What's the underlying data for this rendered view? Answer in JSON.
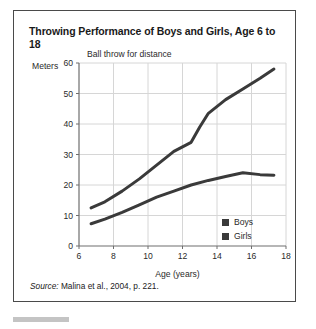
{
  "card": {
    "title": "Throwing Performance of Boys and Girls, Age 6 to 18",
    "subtitle": "Ball throw for distance",
    "source_label": "Source:",
    "source_text": " Malina et al., 2004, p. 221."
  },
  "chart_data": {
    "type": "line",
    "title": "Throwing Performance of Boys and Girls, Age 6 to 18",
    "subtitle": "Ball throw for distance",
    "xlabel": "Age (years)",
    "ylabel": "Meters",
    "xlim": [
      6,
      18
    ],
    "ylim": [
      0,
      60
    ],
    "xticks": [
      6,
      8,
      10,
      12,
      14,
      16,
      18
    ],
    "yticks": [
      0,
      10,
      20,
      30,
      40,
      50,
      60
    ],
    "grid": true,
    "legend_position": "inside-lower-right",
    "line_color": "#3a3a3a",
    "grid_color": "#d6d6d6",
    "axis_color": "#6e6e6e",
    "series": [
      {
        "name": "Boys",
        "color": "#3a3a3a",
        "x": [
          6.7,
          7.5,
          8.5,
          9.5,
          10.5,
          11.5,
          12.0,
          12.5,
          13.0,
          13.5,
          14.5,
          15.5,
          16.5,
          17.3
        ],
        "values": [
          12.5,
          14.5,
          18.0,
          22.0,
          26.5,
          31.0,
          32.5,
          34.0,
          39.0,
          43.5,
          48.0,
          51.5,
          55.0,
          58.0
        ]
      },
      {
        "name": "Girls",
        "color": "#3a3a3a",
        "x": [
          6.7,
          7.5,
          8.5,
          9.5,
          10.5,
          11.5,
          12.5,
          13.5,
          14.5,
          15.5,
          16.5,
          17.3
        ],
        "values": [
          7.3,
          8.8,
          11.0,
          13.5,
          16.0,
          18.0,
          20.0,
          21.5,
          22.8,
          24.0,
          23.4,
          23.2
        ]
      }
    ]
  }
}
